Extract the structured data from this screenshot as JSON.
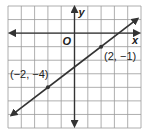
{
  "chart_data": {
    "type": "line",
    "title": "",
    "xlabel": "x",
    "ylabel": "y",
    "origin_label": "O",
    "xlim": [
      -5,
      5
    ],
    "ylim": [
      -7,
      2
    ],
    "grid": true,
    "series": [
      {
        "name": "line through (-2,-4) and (2,-1)",
        "slope": 0.75,
        "intercept": -2.5,
        "x": [
          -2,
          2
        ],
        "y": [
          -4,
          -1
        ],
        "extends_both_ways": true
      }
    ],
    "points": [
      {
        "x": -2,
        "y": -4,
        "label": "(−2, −4)"
      },
      {
        "x": 2,
        "y": -1,
        "label": "(2, −1)"
      }
    ],
    "colors": {
      "grid": "#9a9a9a",
      "axes": "#333333",
      "line": "#333333",
      "background": "#ffffff"
    }
  }
}
